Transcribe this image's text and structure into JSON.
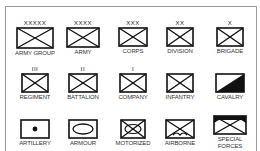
{
  "diagram": {
    "rows": [
      [
        {
          "echelon": "XXXXX",
          "label": "ARMY GROUP",
          "symbol": "infantry-cross"
        },
        {
          "echelon": "XXXX",
          "label": "ARMY",
          "symbol": "infantry-cross"
        },
        {
          "echelon": "XXX",
          "label": "CORPS",
          "symbol": "infantry-cross"
        },
        {
          "echelon": "XX",
          "label": "DIVISION",
          "symbol": "infantry-cross"
        },
        {
          "echelon": "X",
          "label": "BRIGADE",
          "symbol": "infantry-cross"
        }
      ],
      [
        {
          "echelon": "III",
          "label": "REGIMENT",
          "symbol": "infantry-cross"
        },
        {
          "echelon": "II",
          "label": "BATTALION",
          "symbol": "infantry-cross"
        },
        {
          "echelon": "I",
          "label": "COMPANY",
          "symbol": "infantry-cross"
        },
        {
          "echelon": "",
          "label": "INFANTRY",
          "symbol": "infantry-cross"
        },
        {
          "echelon": "",
          "label": "CAVALRY",
          "symbol": "cavalry-diagonal-fill"
        }
      ],
      [
        {
          "echelon": "",
          "label": "ARTILLERY",
          "symbol": "artillery-dot"
        },
        {
          "echelon": "",
          "label": "ARMOUR",
          "symbol": "armour-oval"
        },
        {
          "echelon": "",
          "label": "MOTORIZED",
          "symbol": "motorized-cross-oval"
        },
        {
          "echelon": "",
          "label": "AIRBORNE",
          "symbol": "airborne-cross-wings"
        },
        {
          "echelon": "",
          "label": "SPECIAL FORCES",
          "symbol": "special-forces-cross-fill"
        }
      ]
    ]
  }
}
